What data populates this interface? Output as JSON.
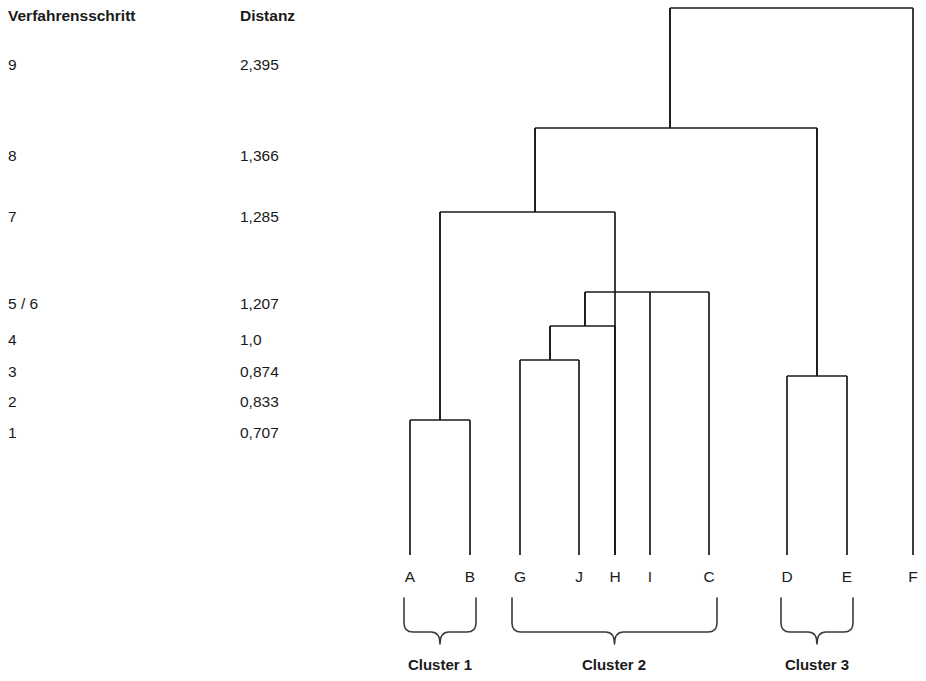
{
  "table": {
    "headers": {
      "step": "Verfahrensschritt",
      "distance": "Distanz"
    },
    "rows": [
      {
        "step": "9",
        "distance": "2,395",
        "y": 57
      },
      {
        "step": "8",
        "distance": "1,366",
        "y": 148
      },
      {
        "step": "7",
        "distance": "1,285",
        "y": 209
      },
      {
        "step": "5 / 6",
        "distance": "1,207",
        "y": 296
      },
      {
        "step": "4",
        "distance": "1,0",
        "y": 332
      },
      {
        "step": "3",
        "distance": "0,874",
        "y": 364
      },
      {
        "step": "2",
        "distance": "0,833",
        "y": 394
      },
      {
        "step": "1",
        "distance": "0,707",
        "y": 425
      }
    ]
  },
  "chart_data": {
    "type": "dendrogram",
    "title": "",
    "xlabel": "",
    "ylabel": "Distanz",
    "orientation": "vertical-top-root",
    "leaves": [
      {
        "label": "A",
        "x": 410
      },
      {
        "label": "B",
        "x": 470
      },
      {
        "label": "G",
        "x": 520
      },
      {
        "label": "J",
        "x": 579
      },
      {
        "label": "H",
        "x": 615
      },
      {
        "label": "I",
        "x": 650
      },
      {
        "label": "C",
        "x": 709
      },
      {
        "label": "D",
        "x": 787
      },
      {
        "label": "E",
        "x": 847
      },
      {
        "label": "F",
        "x": 913
      }
    ],
    "leaf_baseline_y": 555,
    "merges": [
      {
        "step": "1",
        "distance": "0,707",
        "left": "A",
        "right": "B",
        "x1": 410,
        "x2": 470,
        "y": 420,
        "mid": 440
      },
      {
        "step": "2",
        "distance": "0,833",
        "left": "G",
        "right": "J",
        "x1": 520,
        "x2": 579,
        "y": 360,
        "mid": 550
      },
      {
        "step": "3",
        "distance": "0,874",
        "left": "GJ",
        "right": "H",
        "x1": 550,
        "x2": 615,
        "y": 326,
        "mid": 585
      },
      {
        "step": "4",
        "distance": "1,0",
        "left": "D",
        "right": "E",
        "x1": 787,
        "x2": 847,
        "y": 376,
        "mid": 817
      },
      {
        "step": "5 / 6",
        "distance": "1,207",
        "left": "GJH",
        "right": "C",
        "x1": 585,
        "x2": 709,
        "y": 292,
        "mid": 650
      },
      {
        "step": "7",
        "distance": "1,285",
        "left": "AB",
        "right": "GJHIC",
        "x1": 440,
        "x2": 615,
        "y": 212,
        "mid": 535
      },
      {
        "step": "8",
        "distance": "1,366",
        "left": "ABGJHIC",
        "right": "DE",
        "x1": 535,
        "x2": 817,
        "y": 128,
        "mid": 670
      },
      {
        "step": "9",
        "distance": "2,395",
        "left": "ABGJHICDE",
        "right": "F",
        "x1": 670,
        "x2": 913,
        "y": 8,
        "mid": 791
      }
    ],
    "clusters": [
      {
        "label": "Cluster 1",
        "members": [
          "A",
          "B"
        ],
        "x1": 404,
        "x2": 476,
        "label_x": 440
      },
      {
        "label": "Cluster 2",
        "members": [
          "G",
          "J",
          "H",
          "I",
          "C"
        ],
        "x1": 512,
        "x2": 717,
        "label_x": 614
      },
      {
        "label": "Cluster 3",
        "members": [
          "D",
          "E"
        ],
        "x1": 781,
        "x2": 853,
        "label_x": 817
      }
    ],
    "brace_top_y": 598,
    "brace_bottom_y": 640,
    "cluster_label_y": 670,
    "line_color": "#1a1a1a",
    "background_color": "#ffffff"
  }
}
